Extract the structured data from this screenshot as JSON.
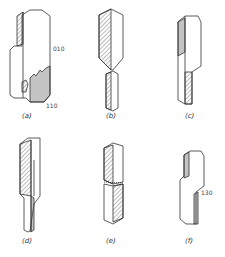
{
  "figure": {
    "panels": [
      {
        "id": "a",
        "label": "(a)",
        "annotations": [
          "010",
          "110"
        ]
      },
      {
        "id": "b",
        "label": "(b)",
        "annotations": []
      },
      {
        "id": "c",
        "label": "(c)",
        "annotations": []
      },
      {
        "id": "d",
        "label": "(d)",
        "annotations": []
      },
      {
        "id": "e",
        "label": "(e)",
        "annotations": []
      },
      {
        "id": "f",
        "label": "(f)",
        "annotations": [
          "130"
        ]
      }
    ]
  },
  "colors": {
    "line": "#333333",
    "hatch": "#555555",
    "background": "#ffffff"
  }
}
